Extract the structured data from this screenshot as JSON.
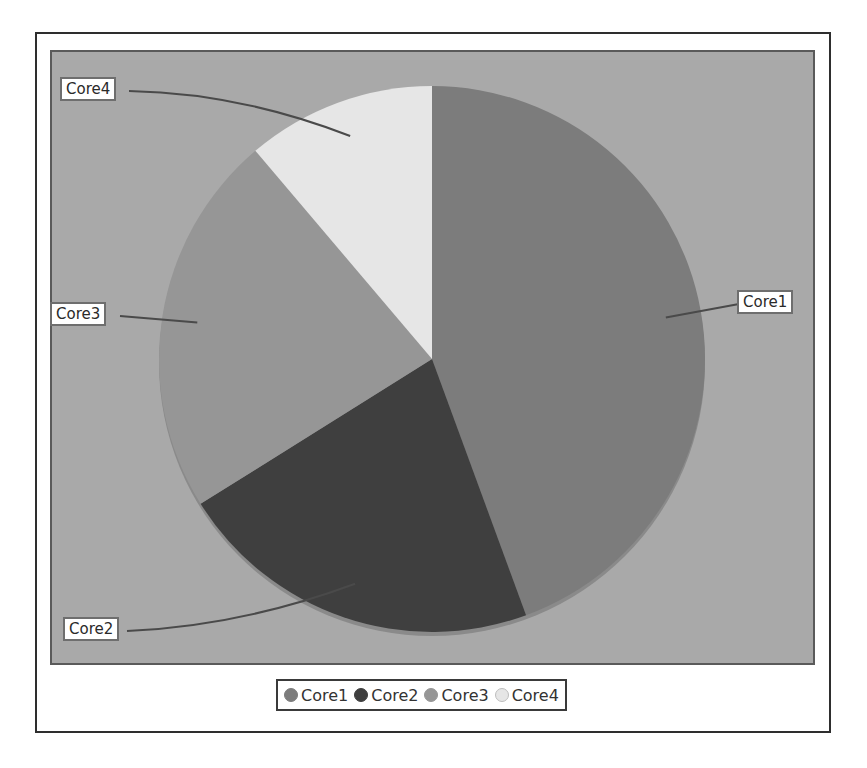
{
  "chart_data": {
    "type": "pie",
    "title": "",
    "categories": [
      "Core1",
      "Core2",
      "Core3",
      "Core4"
    ],
    "values": [
      44.4,
      21.7,
      22.7,
      11.2
    ],
    "units": "percent (estimated from slice angles)",
    "start_angle_deg": 0,
    "direction": "clockwise",
    "colors": [
      "#7c7c7c",
      "#3f3f3f",
      "#969696",
      "#e6e6e6"
    ],
    "legend": {
      "position": "bottom",
      "entries": [
        "Core1",
        "Core2",
        "Core3",
        "Core4"
      ]
    },
    "labels_with_leader_lines": true,
    "background": "#a9a9a9"
  },
  "labels": {
    "core1": "Core1",
    "core2": "Core2",
    "core3": "Core3",
    "core4": "Core4"
  },
  "legend": {
    "items": [
      {
        "label": "Core1",
        "color": "#7c7c7c"
      },
      {
        "label": "Core2",
        "color": "#3f3f3f"
      },
      {
        "label": "Core3",
        "color": "#969696"
      },
      {
        "label": "Core4",
        "color": "#e6e6e6"
      }
    ]
  }
}
